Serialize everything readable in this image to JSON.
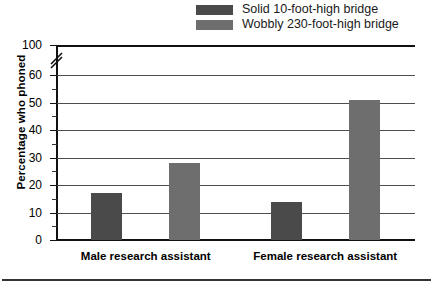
{
  "chart_data": {
    "type": "bar",
    "title": "",
    "xlabel": "",
    "ylabel": "Percentage who phoned",
    "categories": [
      "Male research assistant",
      "Female research assistant"
    ],
    "series": [
      {
        "name": "Solid 10-foot-high bridge",
        "color": "#4a4a4a",
        "values": [
          17,
          14
        ]
      },
      {
        "name": "Wobbly 230-foot-high bridge",
        "color": "#6e6e6e",
        "values": [
          28,
          51
        ]
      }
    ],
    "ylim": [
      0,
      60
    ],
    "y_ticks": [
      0,
      10,
      20,
      30,
      40,
      50,
      60
    ],
    "y_tick_labels": [
      "0",
      "10",
      "20",
      "30",
      "40",
      "50",
      "60"
    ],
    "y_top_label": "100",
    "y_minor_tick_step": 5,
    "axis_break": true,
    "axis_break_between": [
      60,
      100
    ],
    "grid": true,
    "legend_position": "top-right"
  },
  "legend": {
    "entries": [
      {
        "label": "Solid 10-foot-high bridge",
        "color": "#4a4a4a"
      },
      {
        "label": "Wobbly 230-foot-high bridge",
        "color": "#6e6e6e"
      }
    ]
  },
  "axes": {
    "y_title": "Percentage who phoned",
    "y_labels": [
      "60",
      "50",
      "40",
      "30",
      "20",
      "10",
      "0"
    ],
    "y_top_label": "100",
    "x_labels": [
      "Male research assistant",
      "Female research assistant"
    ]
  }
}
